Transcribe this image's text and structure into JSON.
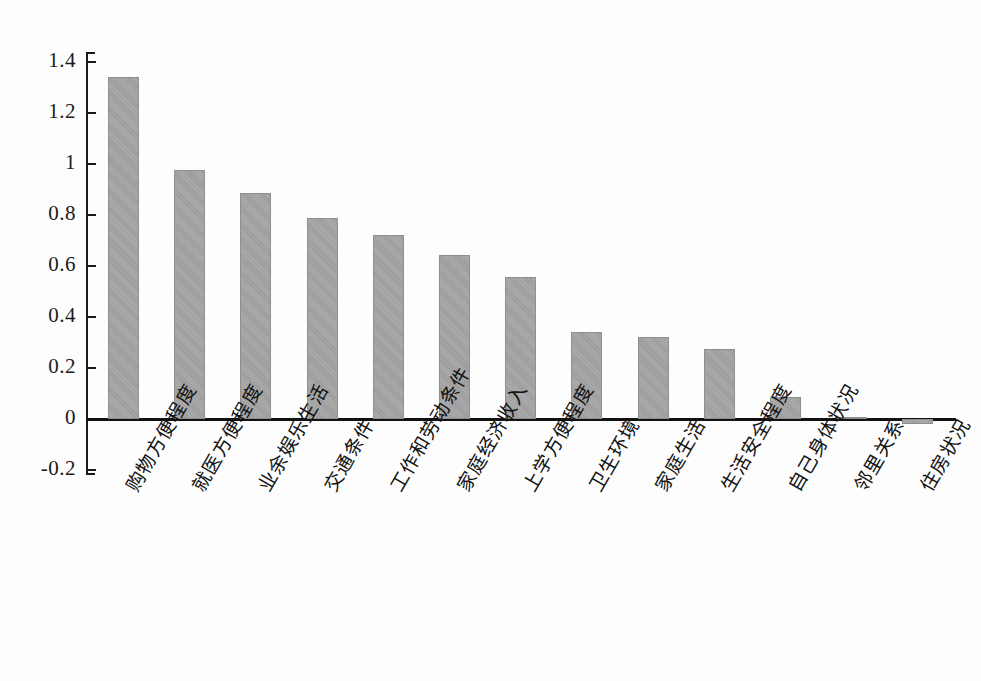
{
  "chart_data": {
    "type": "bar",
    "title": "",
    "subtitle": "",
    "xlabel": "",
    "ylabel": "",
    "ylim": [
      -0.2,
      1.4
    ],
    "grid": false,
    "legend": "none",
    "orientation": "vertical",
    "bar_color": "#a3a3a3",
    "axis_color": "#1a1a1a",
    "y_ticks": [
      "1.4",
      "1.2",
      "1",
      "0.8",
      "0.6",
      "0.4",
      "0.2",
      "0",
      "-0.2"
    ],
    "y_tick_values": [
      1.4,
      1.2,
      1.0,
      0.8,
      0.6,
      0.4,
      0.2,
      0.0,
      -0.2
    ],
    "categories": [
      "购物方便程度",
      "就医方便程度",
      "业余娱乐生活",
      "交通条件",
      "工作和劳动条件",
      "家庭经济收入",
      "上学方便程度",
      "卫生环境",
      "家庭生活",
      "生活安全程度",
      "自己身体状况",
      "邻里关系",
      "住房状况"
    ],
    "values": [
      1.34,
      0.975,
      0.885,
      0.79,
      0.72,
      0.645,
      0.555,
      0.34,
      0.32,
      0.275,
      0.085,
      0.005,
      -0.02
    ]
  }
}
